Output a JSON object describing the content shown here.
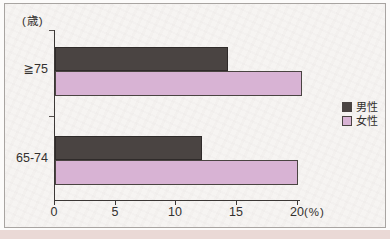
{
  "chart_data": {
    "type": "bar",
    "orientation": "horizontal",
    "title": "",
    "y_axis_unit_label": "(歳)",
    "x_axis_unit_label": "(%)",
    "categories": [
      "≧75",
      "65-74"
    ],
    "series": [
      {
        "name": "男性",
        "color": "#4a4442",
        "values": [
          14.2,
          12.1
        ]
      },
      {
        "name": "女性",
        "color": "#d8b3d4",
        "values": [
          20.3,
          20.0
        ]
      }
    ],
    "xlim": [
      0,
      20
    ],
    "xticks": [
      "0",
      "5",
      "10",
      "15",
      "20"
    ],
    "grid": false,
    "legend_position": "right-middle"
  },
  "colors": {
    "male_bar": "#4a4442",
    "female_bar": "#d8b3d4",
    "axis": "#3c3836",
    "frame_border": "#a8a4a1",
    "card_background": "#f6f4f2",
    "page_bottom_strip": "#ead9d6"
  }
}
